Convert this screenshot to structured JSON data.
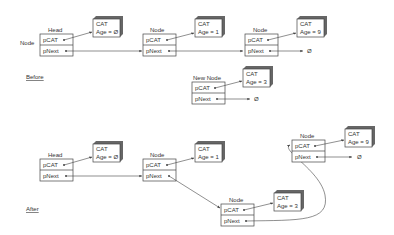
{
  "diagram": {
    "colors": {
      "line": "#444444",
      "box_fill": "#ffffff",
      "shadow": "#555555",
      "text": "#333333"
    },
    "sections": [
      {
        "id": "before",
        "label": "Before"
      },
      {
        "id": "after",
        "label": "After"
      }
    ],
    "field_labels": {
      "pcat": "pCAT",
      "pnext": "pNext"
    },
    "null_symbol": "Ø",
    "side_label": "Node",
    "before": {
      "nodes": [
        {
          "label": "Head",
          "cat": {
            "title": "CAT",
            "age": "Age = Ø"
          }
        },
        {
          "label": "Node",
          "cat": {
            "title": "CAT",
            "age": "Age = 1"
          }
        },
        {
          "label": "Node",
          "cat": {
            "title": "CAT",
            "age": "Age = 9"
          }
        }
      ],
      "new_node": {
        "label": "New Node",
        "cat": {
          "title": "CAT",
          "age": "Age = 3"
        }
      }
    },
    "after": {
      "nodes": [
        {
          "label": "Head",
          "cat": {
            "title": "CAT",
            "age": "Age = Ø"
          }
        },
        {
          "label": "Node",
          "cat": {
            "title": "CAT",
            "age": "Age = 1"
          }
        },
        {
          "label": "Node",
          "cat": {
            "title": "CAT",
            "age": "Age = 3"
          }
        },
        {
          "label": "Node",
          "cat": {
            "title": "CAT",
            "age": "Age = 9"
          }
        }
      ]
    }
  }
}
